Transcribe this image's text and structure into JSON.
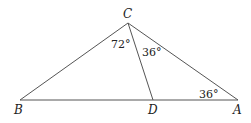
{
  "diagram": {
    "type": "triangle",
    "points": {
      "A": {
        "label": "A",
        "x": 238,
        "y": 100
      },
      "B": {
        "label": "B",
        "x": 20,
        "y": 100
      },
      "C": {
        "label": "C",
        "x": 128,
        "y": 23
      },
      "D": {
        "label": "D",
        "x": 153,
        "y": 100
      }
    },
    "segments": [
      "BC",
      "CA",
      "BA",
      "CD"
    ],
    "angles": [
      {
        "at": "BCD",
        "label": "72°"
      },
      {
        "at": "DCA",
        "label": "36°"
      },
      {
        "at": "CAD",
        "label": "36°"
      }
    ]
  }
}
